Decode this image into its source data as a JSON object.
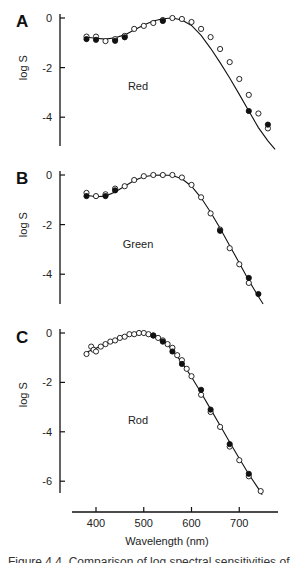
{
  "figure": {
    "xlabel": "Wavelength (nm)",
    "ylabel": "log S",
    "caption_clipped": "Figure 4.4. Comparison of log spectral sensitivities of"
  },
  "chart_data": [
    {
      "panel": "A",
      "type": "scatter",
      "title": "Red",
      "xlabel": "Wavelength (nm)",
      "ylabel": "log S",
      "yticks": [
        0,
        -2,
        -4
      ],
      "ylim": [
        -5.2,
        0.3
      ],
      "xlim": [
        360,
        780
      ],
      "grid": false,
      "legend": "none",
      "fit_curve": [
        [
          380,
          -0.78
        ],
        [
          400,
          -0.82
        ],
        [
          420,
          -0.85
        ],
        [
          440,
          -0.8
        ],
        [
          460,
          -0.68
        ],
        [
          480,
          -0.48
        ],
        [
          500,
          -0.28
        ],
        [
          520,
          -0.12
        ],
        [
          540,
          -0.03
        ],
        [
          560,
          0
        ],
        [
          580,
          -0.08
        ],
        [
          600,
          -0.3
        ],
        [
          620,
          -0.7
        ],
        [
          640,
          -1.22
        ],
        [
          660,
          -1.8
        ],
        [
          680,
          -2.42
        ],
        [
          700,
          -3.08
        ],
        [
          720,
          -3.75
        ],
        [
          740,
          -4.42
        ],
        [
          760,
          -4.95
        ],
        [
          775,
          -5.3
        ]
      ],
      "series": [
        {
          "name": "open",
          "marker": "open-circle",
          "x": [
            380,
            400,
            420,
            440,
            460,
            480,
            500,
            520,
            540,
            560,
            580,
            600,
            620,
            640,
            660,
            680,
            700,
            720,
            740,
            760
          ],
          "y": [
            -0.75,
            -0.75,
            -0.93,
            -0.85,
            -0.72,
            -0.44,
            -0.32,
            -0.2,
            -0.08,
            0,
            -0.04,
            -0.16,
            -0.44,
            -0.77,
            -1.25,
            -1.78,
            -2.46,
            -3.1,
            -3.85,
            -4.45
          ]
        },
        {
          "name": "filled",
          "marker": "filled-circle",
          "x": [
            380,
            400,
            440,
            460,
            540,
            720,
            760
          ],
          "y": [
            -0.85,
            -0.88,
            -0.92,
            -0.78,
            -0.12,
            -3.75,
            -4.3
          ]
        }
      ]
    },
    {
      "panel": "B",
      "type": "scatter",
      "title": "Green",
      "xlabel": "Wavelength (nm)",
      "ylabel": "log S",
      "yticks": [
        0,
        -2,
        -4
      ],
      "ylim": [
        -5.2,
        0.3
      ],
      "xlim": [
        360,
        780
      ],
      "grid": false,
      "legend": "none",
      "fit_curve": [
        [
          380,
          -0.82
        ],
        [
          400,
          -0.88
        ],
        [
          420,
          -0.85
        ],
        [
          440,
          -0.68
        ],
        [
          460,
          -0.45
        ],
        [
          480,
          -0.22
        ],
        [
          500,
          -0.07
        ],
        [
          520,
          -0.01
        ],
        [
          540,
          0
        ],
        [
          560,
          -0.02
        ],
        [
          580,
          -0.15
        ],
        [
          600,
          -0.45
        ],
        [
          620,
          -0.92
        ],
        [
          640,
          -1.5
        ],
        [
          660,
          -2.15
        ],
        [
          680,
          -2.85
        ],
        [
          700,
          -3.55
        ],
        [
          720,
          -4.25
        ],
        [
          740,
          -4.9
        ],
        [
          750,
          -5.2
        ]
      ],
      "series": [
        {
          "name": "open",
          "marker": "open-circle",
          "x": [
            380,
            400,
            420,
            440,
            460,
            480,
            500,
            520,
            540,
            560,
            580,
            600,
            620,
            640,
            660,
            680,
            700,
            720
          ],
          "y": [
            -0.72,
            -0.85,
            -0.78,
            -0.55,
            -0.45,
            -0.2,
            -0.05,
            0,
            0,
            0,
            -0.1,
            -0.4,
            -0.9,
            -1.55,
            -2.2,
            -2.95,
            -3.6,
            -4.35
          ]
        },
        {
          "name": "filled",
          "marker": "filled-circle",
          "x": [
            380,
            420,
            440,
            660,
            720,
            740
          ],
          "y": [
            -0.85,
            -0.85,
            -0.62,
            -2.25,
            -4.15,
            -4.8
          ]
        }
      ]
    },
    {
      "panel": "C",
      "type": "scatter",
      "title": "Rod",
      "xlabel": "Wavelength (nm)",
      "ylabel": "log S",
      "xticks": [
        400,
        500,
        600,
        700
      ],
      "yticks": [
        0,
        -2,
        -4,
        -6
      ],
      "ylim": [
        -6.5,
        0.3
      ],
      "xlim": [
        360,
        780
      ],
      "grid": false,
      "legend": "none",
      "fit_curve": [
        [
          380,
          -0.78
        ],
        [
          400,
          -0.62
        ],
        [
          420,
          -0.45
        ],
        [
          440,
          -0.3
        ],
        [
          460,
          -0.15
        ],
        [
          480,
          -0.04
        ],
        [
          500,
          0
        ],
        [
          520,
          -0.08
        ],
        [
          540,
          -0.3
        ],
        [
          560,
          -0.68
        ],
        [
          580,
          -1.2
        ],
        [
          600,
          -1.78
        ],
        [
          620,
          -2.42
        ],
        [
          640,
          -3.08
        ],
        [
          660,
          -3.75
        ],
        [
          680,
          -4.42
        ],
        [
          700,
          -5.08
        ],
        [
          720,
          -5.72
        ],
        [
          740,
          -6.3
        ],
        [
          748,
          -6.55
        ]
      ],
      "series": [
        {
          "name": "open",
          "marker": "open-circle",
          "x": [
            380,
            390,
            395,
            400,
            410,
            420,
            430,
            440,
            450,
            460,
            470,
            480,
            490,
            500,
            510,
            520,
            530,
            540,
            550,
            560,
            570,
            580,
            590,
            600,
            620,
            640,
            660,
            680,
            700,
            720,
            745
          ],
          "y": [
            -0.85,
            -0.55,
            -0.68,
            -0.75,
            -0.55,
            -0.45,
            -0.35,
            -0.3,
            -0.2,
            -0.15,
            -0.05,
            -0.05,
            0,
            0,
            -0.05,
            -0.1,
            -0.2,
            -0.3,
            -0.45,
            -0.6,
            -0.9,
            -1.1,
            -1.45,
            -1.75,
            -2.5,
            -3.2,
            -3.8,
            -4.6,
            -5.15,
            -5.8,
            -6.4
          ]
        },
        {
          "name": "filled",
          "marker": "filled-circle",
          "x": [
            520,
            540,
            560,
            580,
            620,
            640,
            680,
            720
          ],
          "y": [
            -0.1,
            -0.35,
            -0.75,
            -1.25,
            -2.3,
            -3.1,
            -4.5,
            -5.7
          ]
        }
      ]
    }
  ]
}
